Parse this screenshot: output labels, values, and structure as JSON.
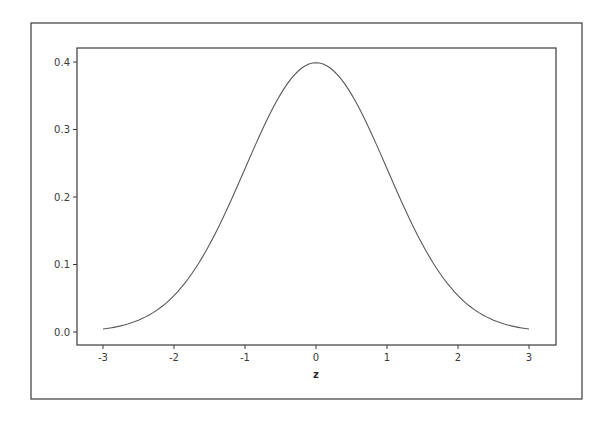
{
  "chart_data": {
    "type": "line",
    "title": "",
    "xlabel": "z",
    "ylabel": "",
    "xlim": [
      -3.2,
      3.35
    ],
    "ylim": [
      -0.019,
      0.42
    ],
    "x_ticks": [
      "-3",
      "-2",
      "-1",
      "0",
      "1",
      "2",
      "3"
    ],
    "y_ticks": [
      "0.0",
      "0.1",
      "0.2",
      "0.3",
      "0.4"
    ],
    "grid": false,
    "legend": null,
    "series": [
      {
        "name": "Standard normal density",
        "x": [
          -3.0,
          -2.5,
          -2.0,
          -1.5,
          -1.0,
          -0.5,
          0.0,
          0.5,
          1.0,
          1.5,
          2.0,
          2.5,
          3.0
        ],
        "values": [
          0.0044,
          0.0175,
          0.054,
          0.1295,
          0.242,
          0.3521,
          0.3989,
          0.3521,
          0.242,
          0.1295,
          0.054,
          0.0175,
          0.0044
        ]
      }
    ]
  },
  "colors": {
    "frame": "#3a3a3a",
    "curve": "#5a5a5a",
    "text": "#3a3a3a",
    "background": "#ffffff"
  }
}
